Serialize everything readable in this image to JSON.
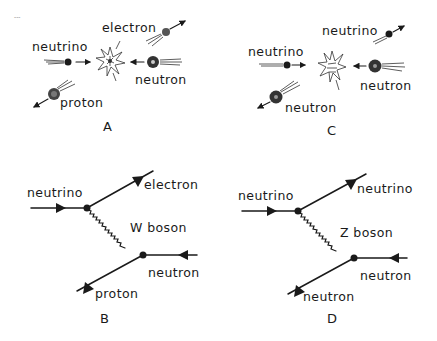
{
  "figure": {
    "stray_mark": "---",
    "panels": {
      "A": {
        "label": "A",
        "type": "collision-sketch",
        "particles": {
          "electron": "electron",
          "neutrino": "neutrino",
          "neutron": "neutron",
          "proton": "proton"
        }
      },
      "C": {
        "label": "C",
        "type": "collision-sketch",
        "particles": {
          "neutrino_out": "neutrino",
          "neutrino_in": "neutrino",
          "neutron_in": "neutron",
          "neutron_out": "neutron"
        }
      },
      "B": {
        "label": "B",
        "type": "feynman-diagram",
        "incoming_left": "neutrino",
        "outgoing_top": "electron",
        "boson": "W boson",
        "incoming_right": "neutron",
        "outgoing_bottom": "proton"
      },
      "D": {
        "label": "D",
        "type": "feynman-diagram",
        "incoming_left": "neutrino",
        "outgoing_top": "neutrino",
        "boson": "Z boson",
        "incoming_right": "neutron",
        "outgoing_bottom": "neutron"
      }
    }
  }
}
